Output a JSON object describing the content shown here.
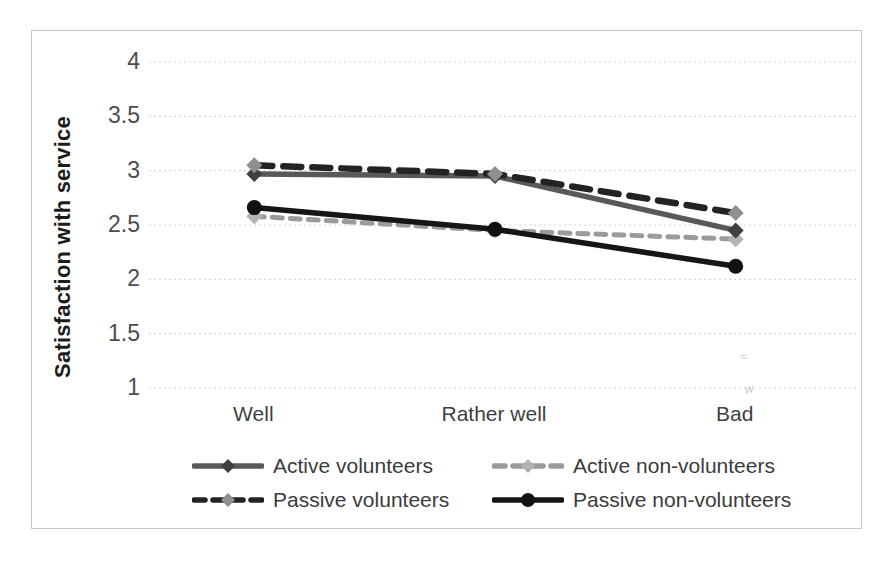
{
  "chart_data": {
    "type": "line",
    "title": "",
    "xlabel": "",
    "ylabel": "Satisfaction with service",
    "categories": [
      "Well",
      "Rather well",
      "Bad"
    ],
    "series": [
      {
        "name": "Active volunteers",
        "values": [
          2.97,
          2.95,
          2.45
        ],
        "color": "#595959",
        "dash": "",
        "marker": "diamond",
        "marker_color": "#3f3f3f"
      },
      {
        "name": "Active non-volunteers",
        "values": [
          2.58,
          2.45,
          2.37
        ],
        "color": "#9b9b9b",
        "dash": "10 8",
        "marker": "diamond",
        "marker_color": "#b4b4b4"
      },
      {
        "name": "Passive volunteers",
        "values": [
          3.05,
          2.97,
          2.61
        ],
        "color": "#232323",
        "dash": "18 11",
        "marker": "diamond",
        "marker_color": "#8f8f8f"
      },
      {
        "name": "Passive non-volunteers",
        "values": [
          2.66,
          2.46,
          2.12
        ],
        "color": "#161616",
        "dash": "",
        "marker": "circle",
        "marker_color": "#111111"
      }
    ],
    "ylim": [
      1,
      4
    ],
    "yticks": [
      4,
      3.5,
      3,
      2.5,
      2,
      1.5,
      1
    ],
    "grid": true,
    "gridline_color": "#d6d6d6",
    "legend_position": "bottom"
  }
}
